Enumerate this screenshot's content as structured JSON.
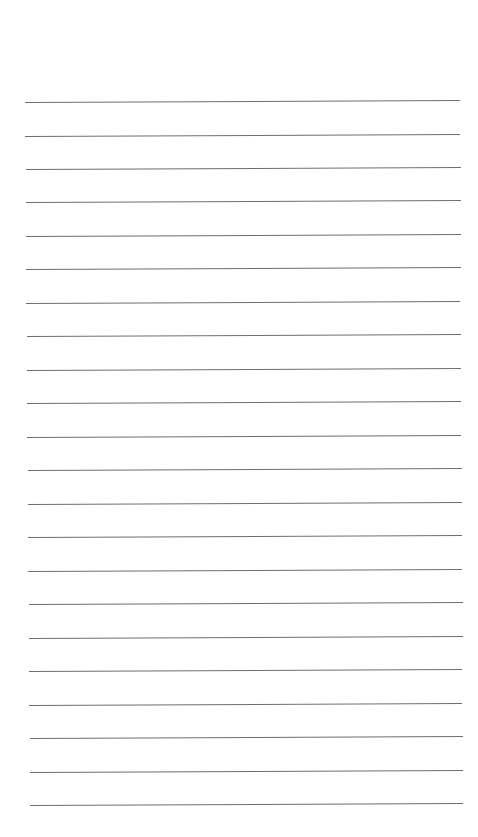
{
  "document": {
    "type": "lined-paper",
    "line_count": 22,
    "line_color": "#6e6e6e",
    "background_color": "#ffffff",
    "text": ""
  }
}
